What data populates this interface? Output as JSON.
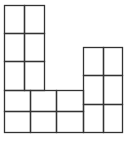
{
  "diagram": {
    "stroke_color": "#333333",
    "background": "#ffffff",
    "cells": [
      {
        "x": 4,
        "y": 5,
        "w": 20,
        "h": 28
      },
      {
        "x": 24,
        "y": 5,
        "w": 20,
        "h": 28
      },
      {
        "x": 4,
        "y": 33,
        "w": 20,
        "h": 28
      },
      {
        "x": 24,
        "y": 33,
        "w": 20,
        "h": 28
      },
      {
        "x": 4,
        "y": 61,
        "w": 20,
        "h": 29
      },
      {
        "x": 24,
        "y": 61,
        "w": 20,
        "h": 29
      },
      {
        "x": 4,
        "y": 90,
        "w": 26,
        "h": 21
      },
      {
        "x": 30,
        "y": 90,
        "w": 26,
        "h": 21
      },
      {
        "x": 56,
        "y": 90,
        "w": 27,
        "h": 21
      },
      {
        "x": 4,
        "y": 111,
        "w": 26,
        "h": 21
      },
      {
        "x": 30,
        "y": 111,
        "w": 26,
        "h": 21
      },
      {
        "x": 56,
        "y": 111,
        "w": 27,
        "h": 21
      },
      {
        "x": 83,
        "y": 47,
        "w": 20,
        "h": 28
      },
      {
        "x": 103,
        "y": 47,
        "w": 19,
        "h": 28
      },
      {
        "x": 83,
        "y": 75,
        "w": 20,
        "h": 29
      },
      {
        "x": 103,
        "y": 75,
        "w": 19,
        "h": 29
      },
      {
        "x": 83,
        "y": 104,
        "w": 20,
        "h": 28
      },
      {
        "x": 103,
        "y": 104,
        "w": 19,
        "h": 28
      }
    ]
  }
}
